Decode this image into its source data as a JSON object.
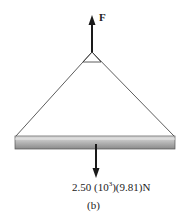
{
  "diagram": {
    "force_label": "F",
    "weight_label_prefix": "2.50 (10",
    "weight_label_exp": "3",
    "weight_label_suffix": ")(9.81)N",
    "caption": "(b)",
    "colors": {
      "line": "#1a1a1a",
      "beam_top": "#d6d6d6",
      "beam_bottom": "#8c8c8c"
    }
  }
}
